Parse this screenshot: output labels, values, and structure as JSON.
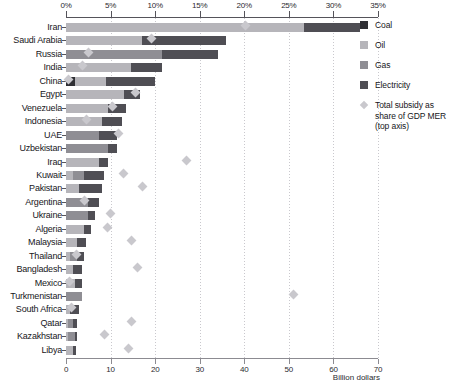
{
  "chart_data": {
    "type": "bar",
    "orientation": "horizontal",
    "stacked": true,
    "title": "",
    "xlabel_bottom": "Billion dollars",
    "xlabel_top": "",
    "grid": true,
    "legend_position": "right",
    "top_axis": {
      "label": "Total subsidy as share of GDP MER (top axis)",
      "ticks": [
        "0%",
        "5%",
        "10%",
        "15%",
        "20%",
        "25%",
        "30%",
        "35%"
      ],
      "values": [
        0,
        5,
        10,
        15,
        20,
        25,
        30,
        35
      ],
      "xlim": [
        0,
        35
      ],
      "unit": "percent"
    },
    "bottom_axis": {
      "label": "Billion dollars",
      "ticks": [
        "0",
        "10",
        "20",
        "30",
        "40",
        "50",
        "60",
        "70"
      ],
      "values": [
        0,
        10,
        20,
        30,
        40,
        50,
        60,
        70
      ],
      "xlim": [
        0,
        70
      ],
      "unit": "billion dollars"
    },
    "series": [
      {
        "name": "Coal",
        "color": "#2f2f34"
      },
      {
        "name": "Oil",
        "color": "#b6b5ba"
      },
      {
        "name": "Gas",
        "color": "#8f8e94"
      },
      {
        "name": "Electricity",
        "color": "#4f4e54"
      }
    ],
    "marker": {
      "name": "Total subsidy as share of GDP MER (top axis)",
      "color": "#c9c8cd",
      "shape": "diamond"
    },
    "categories": [
      "Iran",
      "Saudi Arabia",
      "Russia",
      "India",
      "China",
      "Egypt",
      "Venezuela",
      "Indonesia",
      "UAE",
      "Uzbekistan",
      "Iraq",
      "Kuwait",
      "Pakistan",
      "Argentina",
      "Ukraine",
      "Algeria",
      "Malaysia",
      "Thailand",
      "Bangladesh",
      "Mexico",
      "Turkmenistan",
      "South Africa",
      "Qatar",
      "Kazakhstan",
      "Libya"
    ],
    "rows": [
      {
        "country": "Iran",
        "coal": 0.0,
        "oil": 53.5,
        "gas": 0.0,
        "electricity": 12.5,
        "total": 66.0,
        "gdp_share": 20.1
      },
      {
        "country": "Saudi Arabia",
        "coal": 0.0,
        "oil": 17.0,
        "gas": 0.0,
        "electricity": 19.0,
        "total": 36.0,
        "gdp_share": 9.6
      },
      {
        "country": "Russia",
        "coal": 0.0,
        "oil": 0.0,
        "gas": 21.5,
        "electricity": 12.5,
        "total": 34.0,
        "gdp_share": 2.5
      },
      {
        "country": "India",
        "coal": 0.0,
        "oil": 14.5,
        "gas": 0.0,
        "electricity": 7.0,
        "total": 21.5,
        "gdp_share": 1.8
      },
      {
        "country": "China",
        "coal": 2.0,
        "oil": 7.0,
        "gas": 0.0,
        "electricity": 11.0,
        "total": 20.0,
        "gdp_share": 0.3
      },
      {
        "country": "Egypt",
        "coal": 0.0,
        "oil": 13.0,
        "gas": 0.0,
        "electricity": 3.5,
        "total": 16.5,
        "gdp_share": 7.8
      },
      {
        "country": "Venezuela",
        "coal": 0.0,
        "oil": 9.5,
        "gas": 0.0,
        "electricity": 4.0,
        "total": 13.5,
        "gdp_share": 5.2
      },
      {
        "country": "Indonesia",
        "coal": 0.0,
        "oil": 8.0,
        "gas": 0.0,
        "electricity": 4.5,
        "total": 12.5,
        "gdp_share": 2.3
      },
      {
        "country": "UAE",
        "coal": 0.0,
        "oil": 0.0,
        "gas": 7.5,
        "electricity": 4.0,
        "total": 11.5,
        "gdp_share": 5.9
      },
      {
        "country": "Uzbekistan",
        "coal": 0.0,
        "oil": 0.0,
        "gas": 9.5,
        "electricity": 2.0,
        "total": 11.5,
        "gdp_share": 0.0
      },
      {
        "country": "Iraq",
        "coal": 0.0,
        "oil": 7.5,
        "gas": 0.0,
        "electricity": 2.0,
        "total": 9.5,
        "gdp_share": 13.5
      },
      {
        "country": "Kuwait",
        "coal": 0.0,
        "oil": 1.5,
        "gas": 2.5,
        "electricity": 4.5,
        "total": 8.5,
        "gdp_share": 6.5
      },
      {
        "country": "Pakistan",
        "coal": 0.0,
        "oil": 3.0,
        "gas": 0.0,
        "electricity": 5.0,
        "total": 8.0,
        "gdp_share": 8.6
      },
      {
        "country": "Argentina",
        "coal": 0.0,
        "oil": 0.0,
        "gas": 5.0,
        "electricity": 2.5,
        "total": 7.5,
        "gdp_share": 2.1
      },
      {
        "country": "Ukraine",
        "coal": 0.0,
        "oil": 0.0,
        "gas": 5.0,
        "electricity": 1.5,
        "total": 6.5,
        "gdp_share": 5.0
      },
      {
        "country": "Algeria",
        "coal": 0.0,
        "oil": 4.0,
        "gas": 0.0,
        "electricity": 1.5,
        "total": 5.5,
        "gdp_share": 4.6
      },
      {
        "country": "Malaysia",
        "coal": 0.0,
        "oil": 2.5,
        "gas": 0.0,
        "electricity": 2.0,
        "total": 4.5,
        "gdp_share": 7.4
      },
      {
        "country": "Thailand",
        "coal": 0.0,
        "oil": 1.0,
        "gas": 1.5,
        "electricity": 1.5,
        "total": 4.0,
        "gdp_share": 1.2
      },
      {
        "country": "Bangladesh",
        "coal": 0.0,
        "oil": 1.5,
        "gas": 0.0,
        "electricity": 2.0,
        "total": 3.5,
        "gdp_share": 8.0
      },
      {
        "country": "Mexico",
        "coal": 0.0,
        "oil": 2.0,
        "gas": 0.0,
        "electricity": 1.5,
        "total": 3.5,
        "gdp_share": 0.4
      },
      {
        "country": "Turkmenistan",
        "coal": 0.0,
        "oil": 0.0,
        "gas": 3.5,
        "electricity": 0.0,
        "total": 3.5,
        "gdp_share": 25.5
      },
      {
        "country": "South Africa",
        "coal": 0.0,
        "oil": 1.0,
        "gas": 0.0,
        "electricity": 2.0,
        "total": 3.0,
        "gdp_share": 0.6
      },
      {
        "country": "Qatar",
        "coal": 0.0,
        "oil": 0.5,
        "gas": 1.0,
        "electricity": 1.0,
        "total": 2.5,
        "gdp_share": 7.4
      },
      {
        "country": "Kazakhstan",
        "coal": 0.0,
        "oil": 0.5,
        "gas": 1.5,
        "electricity": 0.5,
        "total": 2.5,
        "gdp_share": 4.3
      },
      {
        "country": "Libya",
        "coal": 0.0,
        "oil": 1.5,
        "gas": 0.0,
        "electricity": 0.8,
        "total": 2.3,
        "gdp_share": 7.0
      }
    ]
  },
  "legend": {
    "items": [
      {
        "label": "Coal",
        "type": "swatch"
      },
      {
        "label": "Oil",
        "type": "swatch"
      },
      {
        "label": "Gas",
        "type": "swatch"
      },
      {
        "label": "Electricity",
        "type": "swatch"
      },
      {
        "label": "Total subsidy as share of GDP MER (top axis)",
        "type": "diamond"
      }
    ]
  }
}
